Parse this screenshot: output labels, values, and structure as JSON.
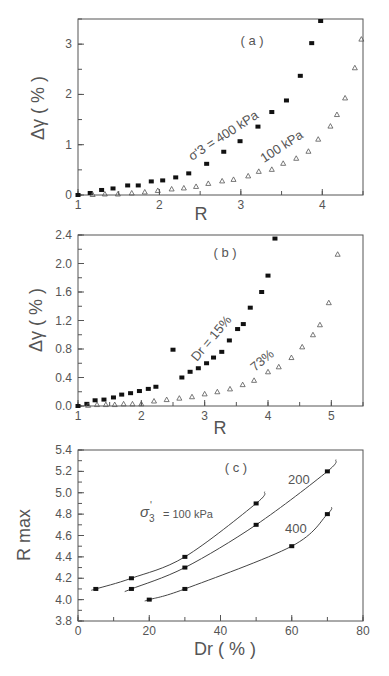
{
  "chart_data": [
    {
      "type": "scatter",
      "panel": "(a)",
      "xlabel": "R",
      "ylabel": "Δγ ( % )",
      "xlim": [
        1,
        4.5
      ],
      "ylim": [
        0,
        3.5
      ],
      "xticks": [
        1,
        2,
        3,
        4
      ],
      "yticks": [
        0,
        1,
        2,
        3
      ],
      "grid": false,
      "series": [
        {
          "name": "σ'3 = 400 kPa",
          "marker": "filled-square",
          "x": [
            1.0,
            1.15,
            1.29,
            1.43,
            1.61,
            1.74,
            1.9,
            2.04,
            2.2,
            2.36,
            2.58,
            2.79,
            2.99,
            3.21,
            3.38,
            3.56,
            3.73,
            3.87,
            3.98
          ],
          "y": [
            0.0,
            0.04,
            0.1,
            0.13,
            0.19,
            0.19,
            0.27,
            0.29,
            0.35,
            0.43,
            0.62,
            0.86,
            1.07,
            1.36,
            1.65,
            1.88,
            2.37,
            3.02,
            3.46
          ]
        },
        {
          "name": "100 kPa",
          "marker": "open-triangle",
          "x": [
            1.18,
            1.33,
            1.49,
            1.66,
            1.82,
            1.98,
            2.15,
            2.3,
            2.45,
            2.6,
            2.77,
            2.91,
            3.09,
            3.22,
            3.38,
            3.52,
            3.68,
            3.83,
            3.95,
            4.1,
            4.18,
            4.28,
            4.4,
            4.48
          ],
          "y": [
            0.01,
            0.02,
            0.02,
            0.04,
            0.06,
            0.09,
            0.12,
            0.14,
            0.17,
            0.23,
            0.28,
            0.31,
            0.38,
            0.47,
            0.51,
            0.63,
            0.73,
            0.87,
            1.11,
            1.37,
            1.6,
            1.93,
            2.53,
            3.1
          ]
        }
      ],
      "annotations": [
        "( a )",
        "σ'3 = 400 kPa",
        "100 kPa"
      ]
    },
    {
      "type": "scatter",
      "panel": "(b)",
      "xlabel": "R",
      "ylabel": "Δγ ( % )",
      "xlim": [
        1,
        5.5
      ],
      "ylim": [
        0,
        2.4
      ],
      "xticks": [
        1,
        2,
        3,
        4,
        5
      ],
      "yticks": [
        0.0,
        0.4,
        0.8,
        1.2,
        1.6,
        2.0,
        2.4
      ],
      "grid": false,
      "series": [
        {
          "name": "Dr = 15%",
          "marker": "filled-square",
          "x": [
            1.0,
            1.14,
            1.27,
            1.41,
            1.56,
            1.69,
            1.83,
            1.97,
            2.11,
            2.23,
            2.5,
            2.64,
            2.77,
            2.9,
            3.03,
            3.14,
            3.27,
            3.39,
            3.52,
            3.61,
            3.72,
            3.9,
            4.0,
            4.11
          ],
          "y": [
            0.0,
            0.03,
            0.08,
            0.09,
            0.12,
            0.16,
            0.18,
            0.21,
            0.24,
            0.27,
            0.79,
            0.4,
            0.48,
            0.53,
            0.6,
            0.68,
            0.76,
            0.92,
            1.08,
            1.15,
            1.38,
            1.6,
            1.83,
            2.35
          ]
        },
        {
          "name": "73%",
          "marker": "open-triangle",
          "x": [
            1.16,
            1.3,
            1.44,
            1.58,
            1.72,
            1.86,
            2.0,
            2.2,
            2.4,
            2.6,
            2.8,
            3.0,
            3.2,
            3.4,
            3.6,
            3.78,
            4.0,
            4.17,
            4.37,
            4.54,
            4.71,
            4.82,
            4.96,
            5.1
          ],
          "y": [
            0.01,
            0.02,
            0.02,
            0.02,
            0.03,
            0.03,
            0.03,
            0.07,
            0.09,
            0.11,
            0.13,
            0.17,
            0.2,
            0.24,
            0.3,
            0.36,
            0.48,
            0.55,
            0.68,
            0.83,
            1.0,
            1.14,
            1.45,
            2.13
          ]
        }
      ],
      "annotations": [
        "( b )",
        "Dr = 15%",
        "73%"
      ]
    },
    {
      "type": "line",
      "panel": "(c)",
      "xlabel": "Dr ( % )",
      "ylabel": "R max",
      "xlim": [
        0,
        80
      ],
      "ylim": [
        3.8,
        5.4
      ],
      "xticks": [
        0,
        20,
        40,
        60,
        80
      ],
      "yticks": [
        3.8,
        4.0,
        4.2,
        4.4,
        4.6,
        4.8,
        5.0,
        5.2,
        5.4
      ],
      "grid": false,
      "series": [
        {
          "name": "σ'3 = 100 kPa",
          "x": [
            5,
            15,
            30,
            50
          ],
          "y": [
            4.1,
            4.2,
            4.4,
            4.9
          ]
        },
        {
          "name": "200",
          "x": [
            15,
            30,
            50,
            70
          ],
          "y": [
            4.1,
            4.3,
            4.7,
            5.2
          ]
        },
        {
          "name": "400",
          "x": [
            20,
            30,
            60,
            70
          ],
          "y": [
            4.0,
            4.1,
            4.5,
            4.8
          ]
        }
      ],
      "annotations": [
        "( c )",
        "σ'3 = 100 kPa",
        "200",
        "400"
      ]
    }
  ],
  "labels": {
    "a": {
      "panel": "( a )",
      "ylabel": "Δγ ( % )",
      "xlabel": "R",
      "s1": "σ'3 = 400 kPa",
      "s2": "100 kPa"
    },
    "b": {
      "panel": "( b )",
      "ylabel": "Δγ ( % )",
      "xlabel": "R",
      "s1": "Dr = 15%",
      "s2": "73%"
    },
    "c": {
      "panel": "( c )",
      "ylabel": "R  max",
      "xlabel": "Dr   (  %  )",
      "s1a": "σ",
      "s1b": "'",
      "s1c": "3",
      "s1d": "= 100 kPa",
      "s2": "200",
      "s3": "400"
    }
  }
}
